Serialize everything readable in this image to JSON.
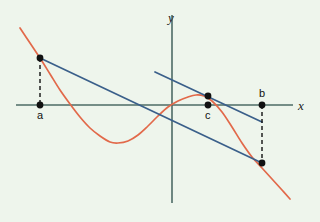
{
  "figure": {
    "background_color": "#eef5ec"
  },
  "axes": {
    "x_label": "x",
    "y_label": "y",
    "axis_color": "#4d6b66",
    "x_axis": {
      "x1": 16,
      "y1": 105,
      "x2": 293,
      "y2": 105
    },
    "y_axis": {
      "x1": 172,
      "y1": 15,
      "x2": 172,
      "y2": 203
    }
  },
  "labels": {
    "a": "a",
    "b": "b",
    "c": "c"
  },
  "colors": {
    "curve": "#e2694a",
    "secant": "#3a5f8a",
    "tangent": "#3a5f8a",
    "point": "#111111",
    "dashed": "#111111",
    "axis": "#4d6b66"
  },
  "chart_data": {
    "type": "line",
    "title": "",
    "xlabel": "x",
    "ylabel": "y",
    "grid": false,
    "legend": "none",
    "series": [
      {
        "name": "f(x)",
        "color": "#e2694a",
        "role": "function-curve",
        "points": [
          [
            20,
            28
          ],
          [
            30,
            43
          ],
          [
            40,
            58
          ],
          [
            50,
            74
          ],
          [
            60,
            90
          ],
          [
            70,
            104
          ],
          [
            80,
            117
          ],
          [
            90,
            128
          ],
          [
            100,
            136
          ],
          [
            110,
            142
          ],
          [
            118,
            143
          ],
          [
            128,
            141
          ],
          [
            138,
            135
          ],
          [
            148,
            126
          ],
          [
            158,
            116
          ],
          [
            168,
            107
          ],
          [
            178,
            101
          ],
          [
            188,
            97
          ],
          [
            196,
            95
          ],
          [
            204,
            96
          ],
          [
            212,
            101
          ],
          [
            222,
            112
          ],
          [
            232,
            127
          ],
          [
            242,
            143
          ],
          [
            252,
            157
          ],
          [
            262,
            168
          ],
          [
            272,
            179
          ],
          [
            282,
            190
          ],
          [
            290,
            199
          ]
        ]
      },
      {
        "name": "secant line through (a, f(a)) and (b, f(b))",
        "color": "#3a5f8a",
        "role": "secant",
        "points": [
          [
            40,
            58
          ],
          [
            262,
            163
          ]
        ]
      },
      {
        "name": "tangent line at c parallel to secant",
        "color": "#3a5f8a",
        "role": "tangent",
        "points": [
          [
            155,
            72
          ],
          [
            262,
            122
          ]
        ]
      }
    ],
    "points": [
      {
        "name": "a-on-axis",
        "x": 40,
        "y": 105,
        "label": "a",
        "label_position": "below"
      },
      {
        "name": "f-of-a",
        "x": 40,
        "y": 58,
        "label": "",
        "label_position": "none"
      },
      {
        "name": "b-on-axis",
        "x": 262,
        "y": 105,
        "label": "b",
        "label_position": "above"
      },
      {
        "name": "f-of-b",
        "x": 262,
        "y": 163,
        "label": "",
        "label_position": "none"
      },
      {
        "name": "c-on-axis",
        "x": 208,
        "y": 105,
        "label": "c",
        "label_position": "below"
      },
      {
        "name": "f-of-c",
        "x": 208,
        "y": 96,
        "label": "",
        "label_position": "none"
      }
    ],
    "dashed_segments": [
      {
        "name": "a-vertical",
        "x1": 40,
        "y1": 58,
        "x2": 40,
        "y2": 105
      },
      {
        "name": "b-vertical",
        "x1": 262,
        "y1": 105,
        "x2": 262,
        "y2": 163
      }
    ],
    "xlim": [
      16,
      293
    ],
    "ylim": [
      203,
      15
    ]
  }
}
